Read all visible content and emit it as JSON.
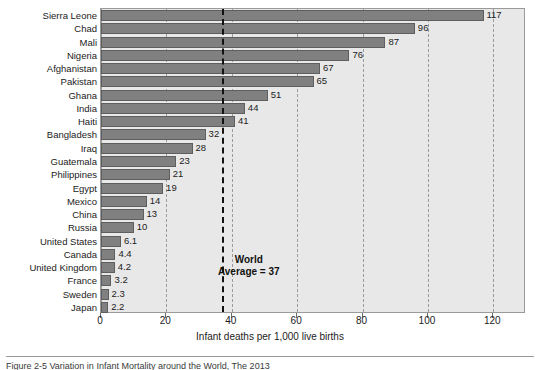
{
  "chart_data": {
    "type": "bar",
    "orientation": "horizontal",
    "title": "",
    "xlabel": "Infant deaths per 1,000 live births",
    "ylabel": "",
    "xlim": [
      0,
      130
    ],
    "xticks": [
      0,
      20,
      40,
      60,
      80,
      100,
      120
    ],
    "xtick_labels": [
      "0",
      "20",
      "40",
      "60",
      "80",
      "100",
      "120"
    ],
    "grid": true,
    "grid_axis": "x",
    "legend": "none",
    "categories": [
      "Sierra Leone",
      "Chad",
      "Mali",
      "Nigeria",
      "Afghanistan",
      "Pakistan",
      "Ghana",
      "India",
      "Haiti",
      "Bangladesh",
      "Iraq",
      "Guatemala",
      "Philippines",
      "Egypt",
      "Mexico",
      "China",
      "Russia",
      "United States",
      "Canada",
      "United Kingdom",
      "France",
      "Sweden",
      "Japan"
    ],
    "values": [
      117,
      96,
      87,
      76,
      67,
      65,
      51,
      44,
      41,
      32,
      28,
      23,
      21,
      19,
      14,
      13,
      10,
      6.1,
      4.4,
      4.2,
      3.2,
      2.3,
      2.2
    ],
    "value_labels": [
      "117",
      "96",
      "87",
      "76",
      "67",
      "65",
      "51",
      "44",
      "41",
      "32",
      "28",
      "23",
      "21",
      "19",
      "14",
      "13",
      "10",
      "6.1",
      "4.4",
      "4.2",
      "3.2",
      "2.3",
      "2.2"
    ],
    "reference_line": {
      "value": 37,
      "label_line1": "World",
      "label_line2": "Average = 37",
      "style": "bold-dashed",
      "color": "#111111"
    },
    "colors": {
      "bar_fill": "#808080",
      "bar_edge": "#5e5e5e",
      "plot_background": "#e8e8e8",
      "grid": "#9b9b9b",
      "text": "#1b1b1b"
    }
  },
  "caption": {
    "text": "Figure 2-5  Variation in Infant Mortality around the World, The 2013"
  }
}
